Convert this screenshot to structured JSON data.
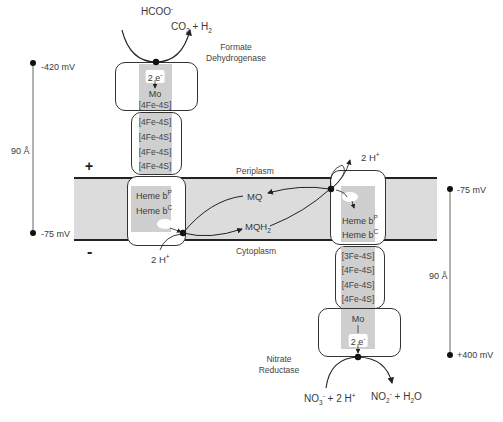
{
  "membrane": {
    "periplasm_label": "Periplasm",
    "cytoplasm_label": "Cytoplasm",
    "plus_sign": "+",
    "minus_sign": "-",
    "colors": {
      "membrane_fill": "#dcdcdc",
      "cofactor_strip": "#cfcfcf",
      "lines": "#222222"
    }
  },
  "formate_dehydrogenase": {
    "name_line1": "Formate",
    "name_line2": "Dehydrogenase",
    "substrate": "HCOO",
    "substrate_charge": "-",
    "products": "CO",
    "products_sub": "2",
    "products_rest": " + H",
    "products_rest_sub": "2",
    "electrons": "2 e",
    "electrons_charge": "-",
    "mo": "Mo",
    "clusters_top": "[4Fe-4S]",
    "clusters": [
      "[4Fe-4S]",
      "[4Fe-4S]",
      "[4Fe-4S]",
      "[4Fe-4S]"
    ],
    "heme_p": "Heme b",
    "heme_p_sup": "P",
    "heme_c": "Heme b",
    "heme_c_sup": "C",
    "protons": "2 H",
    "protons_charge": "+"
  },
  "quinone_pool": {
    "mq": "MQ",
    "mqh2": "MQH",
    "mqh2_sub": "2"
  },
  "nitrate_reductase": {
    "name_line1": "Nitrate",
    "name_line2": "Reductase",
    "protons": "2 H",
    "protons_charge": "+",
    "heme_p": "Heme b",
    "heme_p_sup": "P",
    "heme_c": "Heme b",
    "heme_c_sup": "C",
    "clusters": [
      "[3Fe-4S]",
      "[4Fe-4S]",
      "[4Fe-4S]",
      "[4Fe-4S]"
    ],
    "mo": "Mo",
    "electrons": "2 e",
    "electrons_charge": "-",
    "substrate": "NO",
    "substrate_sub": "3",
    "substrate_charge": "-",
    "substrate_rest": " + 2 H",
    "substrate_rest_charge": "+",
    "product": "NO",
    "product_sub": "2",
    "product_charge": "-",
    "product_rest": " + H",
    "product_rest_sub": "2",
    "product_rest2": "O"
  },
  "left_scale": {
    "top_potential": "-420 mV",
    "bottom_potential": "-75 mV",
    "distance": "90 Å"
  },
  "right_scale": {
    "top_potential": "-75 mV",
    "bottom_potential": "+400 mV",
    "distance": "90 Å"
  }
}
